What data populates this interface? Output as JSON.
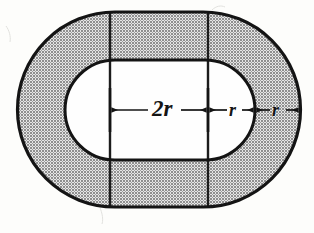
{
  "figure": {
    "background_color": "#fdfdfb",
    "shade_color": "#a8a8a8",
    "stroke_color": "#141414",
    "inner_fill_color": "#fefefe"
  },
  "labels": {
    "inner_width": "2r",
    "gap_right_inner": "r",
    "gap_right_outer": "r"
  },
  "geometry": {
    "outer": {
      "left": 18,
      "right": 300,
      "top": 12,
      "bottom": 207,
      "cap_radius": 97
    },
    "inner": {
      "left": 65,
      "right": 255,
      "top": 60,
      "bottom": 160,
      "cap_radius": 50
    },
    "vertical_lines_x": [
      110,
      208
    ],
    "dimension_line_y": 110,
    "dimension_ticks_x": [
      110,
      208
    ],
    "dimension_segments": [
      {
        "label": "2r",
        "from_x": 110,
        "to_x": 208
      },
      {
        "label": "r",
        "from_x": 208,
        "to_x": 255
      },
      {
        "label": "r",
        "from_x": 255,
        "to_x": 300
      }
    ]
  }
}
